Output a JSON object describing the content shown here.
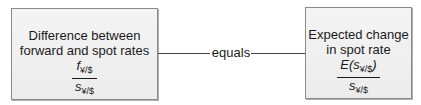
{
  "left_box": {
    "title_line1": "Difference between",
    "title_line2": "forward and spot rates",
    "numerator_var": "f",
    "numerator_sub": "¥/$",
    "denominator_var": "s",
    "denominator_sub": "¥/$"
  },
  "connector": {
    "label": "equals"
  },
  "right_box": {
    "title_line1": "Expected change",
    "title_line2": "in spot rate",
    "numerator_prefix": "E(",
    "numerator_var": "s",
    "numerator_sub": "¥/$",
    "numerator_suffix": ")",
    "denominator_var": "s",
    "denominator_sub": "¥/$"
  },
  "colors": {
    "box_fill": "#f0f0f0",
    "box_border": "#8a8a8a",
    "text": "#1a1a1a",
    "line": "#444444"
  }
}
